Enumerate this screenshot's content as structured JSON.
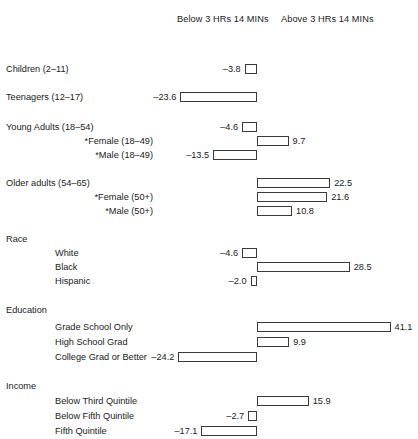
{
  "header": {
    "below_label": "Below 3 HRs 14 MINs",
    "above_label": "Above 3 HRs 14 MINs"
  },
  "chart_data": {
    "type": "bar",
    "title": "",
    "subtitle": "",
    "xlabel": "",
    "ylabel": "",
    "orientation": "horizontal",
    "grid": false,
    "legend_position": "top",
    "legend": [
      "Below 3 HRs 14 MINs",
      "Above 3 HRs 14 MINs"
    ],
    "axis_origin_value": 0,
    "xlim": [
      -30,
      45
    ],
    "note": "Diverging horizontal bar chart; negative values extend left of the zero axis (Below 3 HRs 14 MINs), positive values extend right (Above 3 HRs 14 MINs).",
    "categories": [
      "Children (2–11)",
      "Teenagers (12–17)",
      "Young Adults (18–54)",
      "*Female (18–49)",
      "*Male (18–49)",
      "Older adults (54–65)",
      "*Female (50+)",
      "*Male (50+)",
      "White",
      "Black",
      "Hispanic",
      "Grade School Only",
      "High School Grad",
      "College Grad or Better",
      "Below Third Quintile",
      "Below Fifth Quintile",
      "Fifth Quintile"
    ],
    "values": [
      -3.8,
      -23.6,
      -4.6,
      9.7,
      -13.5,
      22.5,
      21.6,
      10.8,
      -4.6,
      28.5,
      -2.0,
      41.1,
      9.9,
      -24.2,
      15.9,
      -2.7,
      -17.1
    ],
    "group_headings": [
      "Race",
      "Education",
      "Income"
    ]
  },
  "rows": [
    {
      "label": "Children (2–11)",
      "value": -3.8,
      "value_text": "–3.8",
      "level": "main",
      "y": 62
    },
    {
      "label": "Teenagers (12–17)",
      "value": -23.6,
      "value_text": "–23.6",
      "level": "main",
      "y": 90
    },
    {
      "label": "Young Adults (18–54)",
      "value": -4.6,
      "value_text": "–4.6",
      "level": "main",
      "y": 120
    },
    {
      "label": "*Female (18–49)",
      "value": 9.7,
      "value_text": "9.7",
      "level": "sub-right",
      "y": 134
    },
    {
      "label": "*Male (18–49)",
      "value": -13.5,
      "value_text": "–13.5",
      "level": "sub-right",
      "y": 148
    },
    {
      "label": "Older adults (54–65)",
      "value": 22.5,
      "value_text": "22.5",
      "level": "main",
      "y": 176
    },
    {
      "label": "*Female (50+)",
      "value": 21.6,
      "value_text": "21.6",
      "level": "sub-right",
      "y": 190
    },
    {
      "label": "*Male (50+)",
      "value": 10.8,
      "value_text": "10.8",
      "level": "sub-right",
      "y": 204
    },
    {
      "label": "Race",
      "value": null,
      "value_text": "",
      "level": "group",
      "y": 232
    },
    {
      "label": "White",
      "value": -4.6,
      "value_text": "–4.6",
      "level": "sub-left",
      "y": 246
    },
    {
      "label": "Black",
      "value": 28.5,
      "value_text": "28.5",
      "level": "sub-left",
      "y": 260
    },
    {
      "label": "Hispanic",
      "value": -2.0,
      "value_text": "–2.0",
      "level": "sub-left",
      "y": 274
    },
    {
      "label": "Education",
      "value": null,
      "value_text": "",
      "level": "group",
      "y": 303
    },
    {
      "label": "Grade School Only",
      "value": 41.1,
      "value_text": "41.1",
      "level": "sub-left",
      "y": 320
    },
    {
      "label": "High School Grad",
      "value": 9.9,
      "value_text": "9.9",
      "level": "sub-left",
      "y": 335
    },
    {
      "label": "College Grad or Better",
      "value": -24.2,
      "value_text": "–24.2",
      "level": "sub-left",
      "y": 350
    },
    {
      "label": "Income",
      "value": null,
      "value_text": "",
      "level": "group",
      "y": 379
    },
    {
      "label": "Below Third Quintile",
      "value": 15.9,
      "value_text": "15.9",
      "level": "sub-left",
      "y": 394
    },
    {
      "label": "Below Fifth Quintile",
      "value": -2.7,
      "value_text": "–2.7",
      "level": "sub-left",
      "y": 409
    },
    {
      "label": "Fifth Quintile",
      "value": -17.1,
      "value_text": "–17.1",
      "level": "sub-left",
      "y": 424
    }
  ],
  "geometry": {
    "zero_axis_x": 257,
    "px_per_unit": 3.25,
    "value_gap": 4
  }
}
